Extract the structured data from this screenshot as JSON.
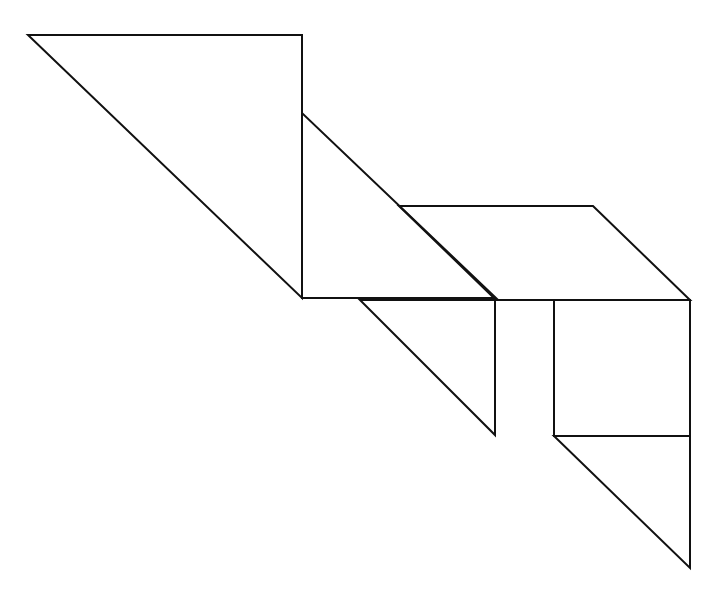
{
  "canvas": {
    "width": 721,
    "height": 595,
    "background": "#ffffff",
    "stroke": "#111111"
  },
  "pieces": [
    {
      "name": "large-triangle-top-left",
      "points": "28,35 302,35 302,298"
    },
    {
      "name": "large-triangle-middle",
      "points": "302,113 302,298 496,298"
    },
    {
      "name": "parallelogram",
      "points": "399,206 593,206 690,300 496,300"
    },
    {
      "name": "medium-triangle",
      "points": "360,300 495,300 495,435"
    },
    {
      "name": "square",
      "points": "554,300 690,300 690,436 554,436"
    },
    {
      "name": "small-triangle-bottom",
      "points": "554,436 690,436 690,568"
    }
  ]
}
